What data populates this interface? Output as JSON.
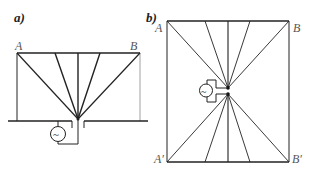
{
  "panel_a": {
    "label": "a)",
    "point_A": "A",
    "point_B": "B",
    "generator_symbol": "~"
  },
  "panel_b": {
    "label": "b)",
    "point_A": "A",
    "point_B": "B",
    "point_A_prime": "A′",
    "point_B_prime": "B′",
    "generator_symbol": "~"
  },
  "colors": {
    "line": "#222222",
    "label": "#555555"
  }
}
